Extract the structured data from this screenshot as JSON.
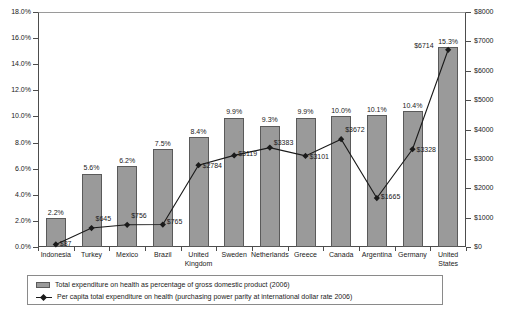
{
  "chart_data": {
    "type": "bar",
    "title": "",
    "subtitle": "",
    "xlabel": "",
    "ylabel": "",
    "grid": false,
    "legend_position": "bottom",
    "categories": [
      "Indonesia",
      "Turkey",
      "Mexico",
      "Brazil",
      "United Kingdom",
      "Sweden",
      "Netherlands",
      "Greece",
      "Canada",
      "Argentina",
      "Germany",
      "United States"
    ],
    "series": [
      {
        "name": "Total expenditure on health as percentage of gross domestic product (2006)",
        "type": "bar",
        "axis": "left",
        "unit": "%",
        "values": [
          2.2,
          5.6,
          6.2,
          7.5,
          8.4,
          9.9,
          9.3,
          9.9,
          10.0,
          10.1,
          10.4,
          15.3
        ],
        "labels": [
          "2.2%",
          "5.6%",
          "6.2%",
          "7.5%",
          "8.4%",
          "9.9%",
          "9.3%",
          "9.9%",
          "10.0%",
          "10.1%",
          "10.4%",
          "15.3%"
        ]
      },
      {
        "name": "Per capita total expenditure on health (purchasing power parity at international dollar rate 2006)",
        "type": "line",
        "axis": "right",
        "unit": "$",
        "values": [
          87,
          645,
          756,
          765,
          2784,
          3119,
          3383,
          3101,
          3672,
          1665,
          3328,
          6714
        ],
        "labels": [
          "$87",
          "$645",
          "$756",
          "$765",
          "$2784",
          "$3119",
          "$3383",
          "$3101",
          "$3672",
          "$1665",
          "$3328",
          "$6714"
        ]
      }
    ],
    "left_axis": {
      "min": 0.0,
      "max": 18.0,
      "step": 2.0,
      "ticks": [
        "0.0%",
        "2.0%",
        "4.0%",
        "6.0%",
        "8.0%",
        "10.0%",
        "12.0%",
        "14.0%",
        "16.0%",
        "18.0%"
      ]
    },
    "right_axis": {
      "min": 0,
      "max": 8000,
      "step": 1000,
      "ticks": [
        "$0",
        "$1000",
        "$2000",
        "$3000",
        "$4000",
        "$5000",
        "$6000",
        "$7000",
        "$8000"
      ]
    },
    "colors": {
      "bar_fill": "#9a9a9a",
      "bar_border": "#5a5a5a",
      "line": "#1a1a1a",
      "axis": "#4d4d4d",
      "text": "#1a1a1a",
      "background": "#ffffff"
    }
  },
  "legend": {
    "items": [
      {
        "marker": "bar-swatch",
        "label": "Total expenditure on health as percentage of gross domestic product (2006)"
      },
      {
        "marker": "line-marker",
        "label": "Per capita total expenditure on health (purchasing power parity at international dollar rate 2006)"
      }
    ]
  }
}
